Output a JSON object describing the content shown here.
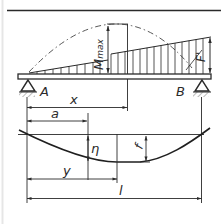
{
  "diagram": {
    "type": "beam-bending-and-deflection",
    "colors": {
      "line": "#2a2a2a",
      "background": "#ffffff",
      "frame": "#e6e6e6"
    },
    "labels": {
      "support_left": "A",
      "support_right": "B",
      "moment_max": "Mmax",
      "moment_max_base": "M",
      "moment_max_sub": "max",
      "force": "F",
      "force_prime": "'",
      "dim_x": "x",
      "dim_a": "a",
      "deflection_eta": "η",
      "deflection_max": "f",
      "dim_y": "y",
      "span_length": "l"
    }
  }
}
